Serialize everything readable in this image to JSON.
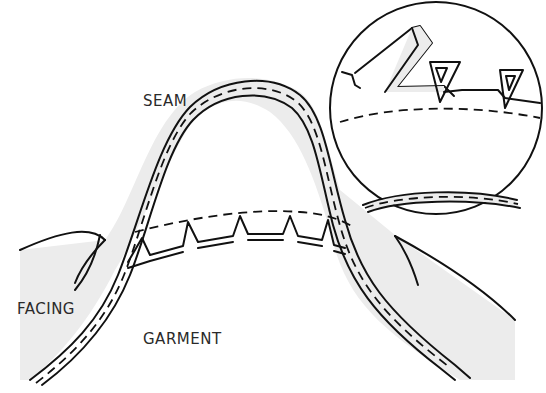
{
  "diagram": {
    "labels": {
      "seam": "SEAM",
      "facing": "FACING",
      "garment": "GARMENT"
    },
    "parts": [
      {
        "name": "seam",
        "description": "Arched seam line with stitching (dashed) joining facing and garment"
      },
      {
        "name": "facing",
        "description": "Shaded fabric piece turned to the inside"
      },
      {
        "name": "garment",
        "description": "Main fabric piece below the seam"
      },
      {
        "name": "notches",
        "description": "V-shaped notches cut into the seam allowance"
      },
      {
        "name": "magnifier-inset",
        "description": "Circular close-up of notched seam allowance"
      }
    ],
    "colors": {
      "line": "#111111",
      "facing_fill": "#ececec",
      "background": "#ffffff"
    }
  }
}
